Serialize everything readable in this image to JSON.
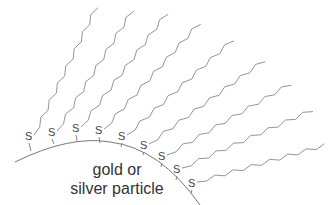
{
  "particle": {
    "label_line1": "gold or",
    "label_line2": "silver particle"
  },
  "ligand_atom": "S",
  "ligand_count": 10,
  "colors": {
    "line": "#777777",
    "text": "#333333",
    "background": "#ffffff"
  }
}
